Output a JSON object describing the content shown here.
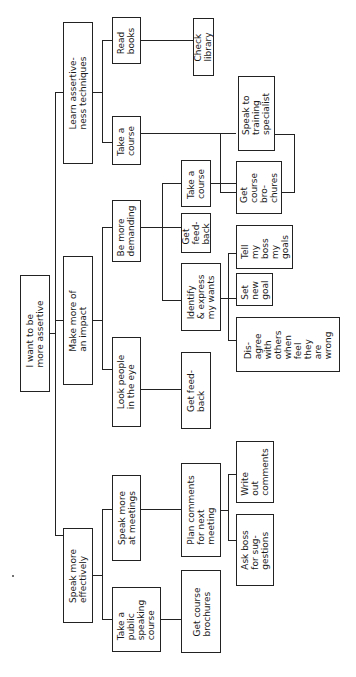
{
  "diagram": {
    "type": "goal-tree",
    "orientation": "rotated-90-ccw",
    "root": {
      "label": "I want to be\nmore assertive"
    },
    "nodes": {
      "learn": {
        "label": "Learn assertive-\nness techniques"
      },
      "read_books": {
        "label": "Read\nbooks"
      },
      "check_library": {
        "label": "Check\nlibrary"
      },
      "take_course_a": {
        "label": "Take a\ncourse"
      },
      "speak_specialist": {
        "label": "Speak to\ntraining\nspecialist"
      },
      "get_brochures_a": {
        "label": "Get\ncourse\nbro-\nchures"
      },
      "impact": {
        "label": "Make more of\nan impact"
      },
      "demanding": {
        "label": "Be more\ndemanding"
      },
      "take_course_b": {
        "label": "Take a\ncourse"
      },
      "get_feedback_b": {
        "label": "Get\nfeed-\nback"
      },
      "identify": {
        "label": "Identify\n& express\nmy wants"
      },
      "tell_boss": {
        "label": "Tell\nmy\nboss\nmy\ngoals"
      },
      "set_goal": {
        "label": "Set\nnew\ngoal"
      },
      "disagree": {
        "label": "Dis-\nagree\nwith\nothers\nwhen\nfeel\nthey\nare\nwrong"
      },
      "look_eye": {
        "label": "Look people\nin the eye"
      },
      "get_feedback_eye": {
        "label": "Get feed-\nback"
      },
      "speak_eff": {
        "label": "Speak more\neffectively"
      },
      "speak_meet": {
        "label": "Speak more\nat meetings"
      },
      "plan_comments": {
        "label": "Plan comments\nfor next\nmeeting"
      },
      "write_comments": {
        "label": "Write\nout\ncomments"
      },
      "ask_boss": {
        "label": "Ask boss\nfor sug-\ngestions"
      },
      "public_course": {
        "label": "Take a\npublic\nspeaking\ncourse"
      },
      "get_brochures_c": {
        "label": "Get course\nbrochures"
      }
    },
    "edges": [
      [
        "root",
        "learn"
      ],
      [
        "root",
        "impact"
      ],
      [
        "root",
        "speak_eff"
      ],
      [
        "learn",
        "read_books"
      ],
      [
        "learn",
        "take_course_a"
      ],
      [
        "read_books",
        "check_library"
      ],
      [
        "take_course_a",
        "speak_specialist"
      ],
      [
        "take_course_a",
        "get_brochures_a"
      ],
      [
        "impact",
        "demanding"
      ],
      [
        "impact",
        "look_eye"
      ],
      [
        "demanding",
        "take_course_b"
      ],
      [
        "demanding",
        "get_feedback_b"
      ],
      [
        "demanding",
        "identify"
      ],
      [
        "take_course_b",
        "get_brochures_a"
      ],
      [
        "identify",
        "tell_boss"
      ],
      [
        "identify",
        "set_goal"
      ],
      [
        "identify",
        "disagree"
      ],
      [
        "look_eye",
        "get_feedback_eye"
      ],
      [
        "speak_eff",
        "speak_meet"
      ],
      [
        "speak_eff",
        "public_course"
      ],
      [
        "speak_meet",
        "plan_comments"
      ],
      [
        "plan_comments",
        "write_comments"
      ],
      [
        "plan_comments",
        "ask_boss"
      ],
      [
        "public_course",
        "get_brochures_c"
      ]
    ]
  }
}
